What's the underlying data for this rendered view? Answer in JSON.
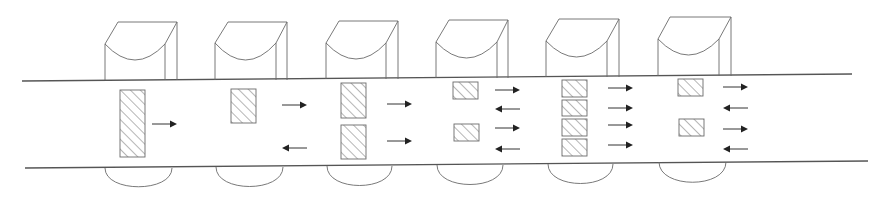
{
  "diagram": {
    "type": "road-with-gantry-units",
    "colors": {
      "background": "#ffffff",
      "line": "#6a6a6a",
      "road": "#555555",
      "arrow": "#222222",
      "hatch": "#7a7a7a"
    },
    "road": {
      "top": {
        "x1": 22,
        "y1": 81,
        "x2": 852,
        "y2": 74
      },
      "bottom": {
        "x1": 25,
        "y1": 168,
        "x2": 868,
        "y2": 161
      }
    },
    "units": [
      {
        "id": 1,
        "top": {
          "left": 105,
          "inner": 165,
          "right": 177,
          "topLeft": 118,
          "topY": 22,
          "shoulderY": 44,
          "arcDepth": 60,
          "baseY": 80
        },
        "bottom": {
          "left": 105,
          "right": 172,
          "roadY": 168,
          "depth": 193
        },
        "vehicles": [
          {
            "x": 120,
            "y": 90,
            "w": 25,
            "h": 67
          }
        ],
        "arrows": [
          {
            "x1": 152,
            "x2": 177,
            "y": 124,
            "dir": "right"
          }
        ]
      },
      {
        "id": 2,
        "top": {
          "left": 215,
          "inner": 276,
          "right": 287,
          "topLeft": 228,
          "topY": 22,
          "shoulderY": 43,
          "arcDepth": 60,
          "baseY": 80
        },
        "bottom": {
          "left": 216,
          "right": 283,
          "roadY": 167,
          "depth": 193
        },
        "vehicles": [
          {
            "x": 231,
            "y": 89,
            "w": 25,
            "h": 34
          }
        ],
        "arrows": [
          {
            "x1": 282,
            "x2": 307,
            "y": 105,
            "dir": "right"
          },
          {
            "x1": 282,
            "x2": 307,
            "y": 148,
            "dir": "left"
          }
        ]
      },
      {
        "id": 3,
        "top": {
          "left": 326,
          "inner": 386,
          "right": 398,
          "topLeft": 339,
          "topY": 21,
          "shoulderY": 43,
          "arcDepth": 59,
          "baseY": 79
        },
        "bottom": {
          "left": 327,
          "right": 392,
          "roadY": 166,
          "depth": 192
        },
        "vehicles": [
          {
            "x": 341,
            "y": 83,
            "w": 25,
            "h": 35
          },
          {
            "x": 341,
            "y": 125,
            "w": 25,
            "h": 34
          }
        ],
        "arrows": [
          {
            "x1": 387,
            "x2": 412,
            "y": 104,
            "dir": "right"
          },
          {
            "x1": 387,
            "x2": 412,
            "y": 141,
            "dir": "right"
          }
        ]
      },
      {
        "id": 4,
        "top": {
          "left": 436,
          "inner": 497,
          "right": 508,
          "topLeft": 449,
          "topY": 20,
          "shoulderY": 42,
          "arcDepth": 58,
          "baseY": 78
        },
        "bottom": {
          "left": 437,
          "right": 503,
          "roadY": 165,
          "depth": 191
        },
        "vehicles": [
          {
            "x": 453,
            "y": 82,
            "w": 25,
            "h": 17
          },
          {
            "x": 454,
            "y": 124,
            "w": 25,
            "h": 17
          }
        ],
        "arrows": [
          {
            "x1": 495,
            "x2": 520,
            "y": 90,
            "dir": "right"
          },
          {
            "x1": 495,
            "x2": 520,
            "y": 109,
            "dir": "left"
          },
          {
            "x1": 495,
            "x2": 520,
            "y": 128,
            "dir": "right"
          },
          {
            "x1": 495,
            "x2": 520,
            "y": 149,
            "dir": "left"
          }
        ]
      },
      {
        "id": 5,
        "top": {
          "left": 546,
          "inner": 607,
          "right": 619,
          "topLeft": 559,
          "topY": 19,
          "shoulderY": 41,
          "arcDepth": 57,
          "baseY": 77
        },
        "bottom": {
          "left": 548,
          "right": 613,
          "roadY": 164,
          "depth": 190
        },
        "vehicles": [
          {
            "x": 562,
            "y": 80,
            "w": 25,
            "h": 17
          },
          {
            "x": 562,
            "y": 100,
            "w": 25,
            "h": 16
          },
          {
            "x": 562,
            "y": 119,
            "w": 25,
            "h": 17
          },
          {
            "x": 562,
            "y": 139,
            "w": 25,
            "h": 17
          }
        ],
        "arrows": [
          {
            "x1": 608,
            "x2": 633,
            "y": 88,
            "dir": "right"
          },
          {
            "x1": 608,
            "x2": 633,
            "y": 108,
            "dir": "right"
          },
          {
            "x1": 608,
            "x2": 633,
            "y": 125,
            "dir": "right"
          },
          {
            "x1": 608,
            "x2": 633,
            "y": 145,
            "dir": "right"
          }
        ]
      },
      {
        "id": 6,
        "top": {
          "left": 658,
          "inner": 719,
          "right": 731,
          "topLeft": 670,
          "topY": 17,
          "shoulderY": 39,
          "arcDepth": 55,
          "baseY": 76
        },
        "bottom": {
          "left": 659,
          "right": 726,
          "roadY": 162,
          "depth": 189
        },
        "vehicles": [
          {
            "x": 678,
            "y": 79,
            "w": 25,
            "h": 17
          },
          {
            "x": 679,
            "y": 119,
            "w": 25,
            "h": 17
          }
        ],
        "arrows": [
          {
            "x1": 723,
            "x2": 748,
            "y": 87,
            "dir": "right"
          },
          {
            "x1": 723,
            "x2": 748,
            "y": 108,
            "dir": "left"
          },
          {
            "x1": 723,
            "x2": 748,
            "y": 129,
            "dir": "right"
          },
          {
            "x1": 723,
            "x2": 748,
            "y": 149,
            "dir": "left"
          }
        ]
      }
    ]
  }
}
